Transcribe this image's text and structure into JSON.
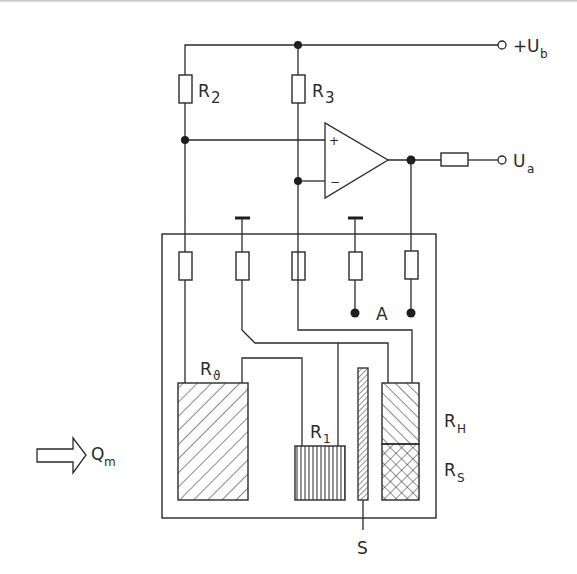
{
  "diagram": {
    "type": "circuit-schematic",
    "colors": {
      "line": "#2a2a2a",
      "background": "#ffffff"
    },
    "terminals": {
      "supply": {
        "sign": "+",
        "symbol": "U",
        "subscript": "b"
      },
      "output": {
        "symbol": "U",
        "subscript": "a"
      }
    },
    "resistors": {
      "r2": {
        "symbol": "R",
        "subscript": "2"
      },
      "r3": {
        "symbol": "R",
        "subscript": "3"
      },
      "r_theta": {
        "symbol": "R",
        "subscript": "ϑ"
      },
      "r1": {
        "symbol": "R",
        "subscript": "1"
      },
      "rh": {
        "symbol": "R",
        "subscript": "H"
      },
      "rs": {
        "symbol": "R",
        "subscript": "S"
      }
    },
    "opamp": {
      "plus": "+",
      "minus": "−"
    },
    "labels": {
      "point_a": "A",
      "sensor_s": "S",
      "flow": {
        "symbol": "Q",
        "subscript": "m"
      }
    }
  }
}
